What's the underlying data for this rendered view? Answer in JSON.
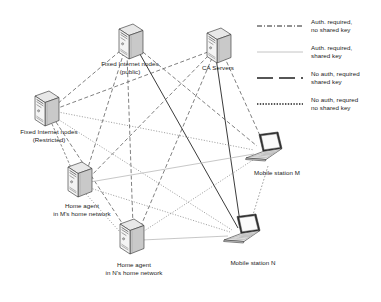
{
  "diagram": {
    "nodes": [
      {
        "id": "fixed_public",
        "label_line1": "Fixed Internet nodes",
        "label_line2": "(public)",
        "icon": "tower-computer-icon",
        "x": 130,
        "y": 45,
        "label_x": 130,
        "label_y": 64
      },
      {
        "id": "ca_servers",
        "label_line1": "CA Servers",
        "label_line2": "",
        "icon": "tower-computer-icon",
        "x": 218,
        "y": 49,
        "label_x": 218,
        "label_y": 68
      },
      {
        "id": "fixed_restr",
        "label_line1": "Fixed Internet nodes",
        "label_line2": "(Restricted)",
        "icon": "tower-computer-icon",
        "x": 46,
        "y": 112,
        "label_x": 49,
        "label_y": 131
      },
      {
        "id": "home_agent_m",
        "label_line1": "Home agent",
        "label_line2": "in M's home network",
        "icon": "tower-computer-icon",
        "x": 79,
        "y": 183,
        "label_x": 82,
        "label_y": 205
      },
      {
        "id": "home_agent_n",
        "label_line1": "Home agent",
        "label_line2": "in N's home network",
        "icon": "tower-computer-icon",
        "x": 131,
        "y": 240,
        "label_x": 134,
        "label_y": 267
      },
      {
        "id": "mobile_m",
        "label_line1": "Mobile station M",
        "label_line2": "",
        "icon": "laptop-icon",
        "x": 269,
        "y": 150,
        "label_x": 275,
        "label_y": 170
      },
      {
        "id": "mobile_n",
        "label_line1": "Mobile station N",
        "label_line2": "",
        "icon": "laptop-icon",
        "x": 247,
        "y": 232,
        "label_x": 253,
        "label_y": 258
      }
    ],
    "links": [
      {
        "from": "fixed_public",
        "to": "mobile_m",
        "style": "dash"
      },
      {
        "from": "fixed_public",
        "to": "mobile_n",
        "style": "solid-dark"
      },
      {
        "from": "fixed_public",
        "to": "home_agent_m",
        "style": "dash"
      },
      {
        "from": "fixed_public",
        "to": "home_agent_n",
        "style": "dash"
      },
      {
        "from": "fixed_public",
        "to": "fixed_restr",
        "style": "dash"
      },
      {
        "from": "ca_servers",
        "to": "fixed_restr",
        "style": "dash"
      },
      {
        "from": "ca_servers",
        "to": "home_agent_m",
        "style": "dash"
      },
      {
        "from": "ca_servers",
        "to": "home_agent_n",
        "style": "dash"
      },
      {
        "from": "ca_servers",
        "to": "mobile_n",
        "style": "solid-dark"
      },
      {
        "from": "ca_servers",
        "to": "mobile_m",
        "style": "dash"
      },
      {
        "from": "fixed_restr",
        "to": "mobile_m",
        "style": "dot"
      },
      {
        "from": "fixed_restr",
        "to": "mobile_n",
        "style": "dot"
      },
      {
        "from": "fixed_restr",
        "to": "home_agent_m",
        "style": "dash"
      },
      {
        "from": "fixed_restr",
        "to": "home_agent_n",
        "style": "dash"
      },
      {
        "from": "home_agent_m",
        "to": "mobile_m",
        "style": "gray-solid"
      },
      {
        "from": "home_agent_m",
        "to": "mobile_n",
        "style": "dot"
      },
      {
        "from": "home_agent_n",
        "to": "mobile_n",
        "style": "gray-solid"
      },
      {
        "from": "home_agent_n",
        "to": "mobile_m",
        "style": "dot"
      },
      {
        "from": "home_agent_m",
        "to": "home_agent_n",
        "style": "dot"
      },
      {
        "from": "mobile_m",
        "to": "mobile_n",
        "style": "dot"
      }
    ]
  },
  "legend": {
    "title": "",
    "entries": [
      {
        "id": "auth_no_key",
        "sample": "dashdot-line-sample",
        "line1": "Auth. required,",
        "line2": "no shared key"
      },
      {
        "id": "auth_key",
        "sample": "gray-solid-line-sample",
        "line1": "Auth. required,",
        "line2": "shared key"
      },
      {
        "id": "noauth_key",
        "sample": "longdash-line-sample",
        "line1": "No auth, required",
        "line2": "shared key"
      },
      {
        "id": "noauth_no_key",
        "sample": "dotted-line-sample",
        "line1": "No auth, requred",
        "line2": "no shared key"
      }
    ]
  },
  "colors": {
    "ink": "#1a1a1a",
    "dash_line": "#555555",
    "gray_line": "#b8b8b8",
    "tower_front": "#f2f2f2",
    "tower_side": "#cfcfcf",
    "tower_top": "#e4e4e4",
    "background": "#ffffff"
  }
}
